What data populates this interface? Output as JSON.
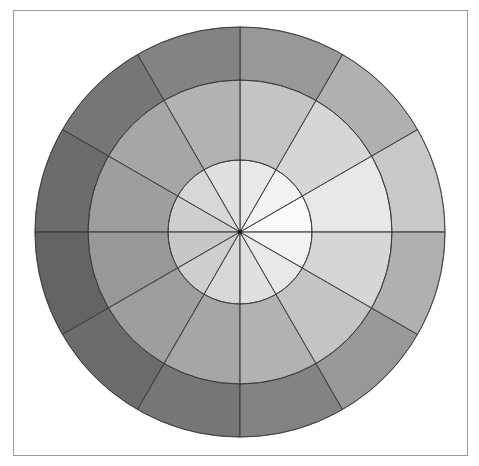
{
  "figure": {
    "title": "",
    "background_color": "#ffffff",
    "frame": {
      "border_color": "#9a9a9a",
      "x": 13,
      "y": 10,
      "width": 455,
      "height": 446
    }
  },
  "chart_data": {
    "type": "pie",
    "subtype": "polar-sector-grid",
    "title": "",
    "subtitle": "",
    "xlabel": "",
    "ylabel": "",
    "grid": false,
    "legend_position": "none",
    "center": {
      "x": 240,
      "y": 232
    },
    "sector_count": 12,
    "ring_count": 3,
    "sector_angle_degrees": 30,
    "angle_offset_degrees": 0,
    "ring_radii": [
      0,
      72,
      152,
      205
    ],
    "ring_names": [
      "inner",
      "middle",
      "outer"
    ],
    "stroke_color": "#3a3a3a",
    "categories": [
      "0°",
      "30°",
      "60°",
      "90°",
      "120°",
      "150°",
      "180°",
      "210°",
      "240°",
      "270°",
      "300°",
      "330°"
    ],
    "series": [
      {
        "name": "inner",
        "radius_inner": 0,
        "radius_outer": 72,
        "values": [
          250,
          243,
          232,
          224,
          215,
          206,
          199,
          206,
          215,
          224,
          232,
          243
        ],
        "colors": [
          "#fafafa",
          "#f3f3f3",
          "#e8e8e8",
          "#e0e0e0",
          "#d7d7d7",
          "#cecece",
          "#c7c7c7",
          "#cecece",
          "#d7d7d7",
          "#e0e0e0",
          "#e8e8e8",
          "#f3f3f3"
        ]
      },
      {
        "name": "middle",
        "radius_inner": 72,
        "radius_outer": 152,
        "values": [
          232,
          214,
          196,
          178,
          166,
          158,
          152,
          158,
          166,
          178,
          196,
          214
        ],
        "colors": [
          "#e8e8e8",
          "#d6d6d6",
          "#c4c4c4",
          "#b2b2b2",
          "#a6a6a6",
          "#9e9e9e",
          "#989898",
          "#9e9e9e",
          "#a6a6a6",
          "#b2b2b2",
          "#c4c4c4",
          "#d6d6d6"
        ]
      },
      {
        "name": "outer",
        "radius_inner": 152,
        "radius_outer": 205,
        "values": [
          200,
          176,
          152,
          131,
          118,
          108,
          100,
          108,
          118,
          131,
          152,
          176
        ]
      }
    ],
    "outer_ring_colors_cw_from_east": [
      "#c8c8c8",
      "#b0b0b0",
      "#989898",
      "#838383",
      "#767676",
      "#6c6c6c",
      "#646464",
      "#6c6c6c",
      "#767676",
      "#838383",
      "#989898",
      "#b0b0b0"
    ],
    "value_range": [
      100,
      250
    ],
    "colormap": "grays"
  }
}
